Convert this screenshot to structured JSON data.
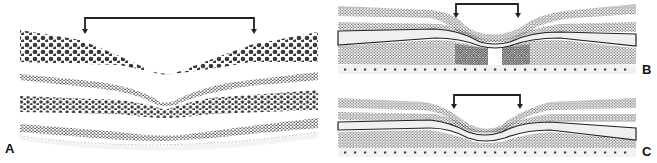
{
  "figure": {
    "panels": [
      {
        "id": "A",
        "label": "A",
        "description": "Foveal pit cross-section with dot layers, bracket above pit"
      },
      {
        "id": "B",
        "label": "B",
        "description": "Foveal pit with central gap in inner layers, bracket above pit"
      },
      {
        "id": "C",
        "label": "C",
        "description": "Deeper, narrower foveal pit with compressed layers, bracket above pit"
      }
    ],
    "colors": {
      "dot": "#3a3a3a",
      "line": "#222222",
      "band_fill": "#f0f0f0",
      "background": "#ffffff"
    }
  }
}
